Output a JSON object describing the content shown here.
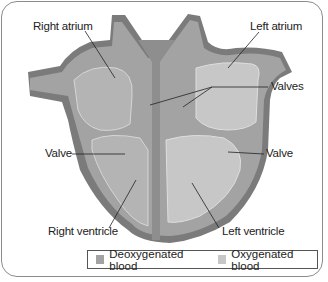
{
  "colors": {
    "deoxygenated": "#a3a3a3",
    "oxygenated": "#c7c7c7",
    "wall": "#7b7b7b",
    "outline": "#8c8c8c"
  },
  "labels": {
    "right_atrium": "Right atrium",
    "left_atrium": "Left atrium",
    "valves": "Valves",
    "valve_left": "Valve",
    "valve_right": "Valve",
    "right_ventricle": "Right ventricle",
    "left_ventricle": "Left ventricle"
  },
  "legend": {
    "items": [
      {
        "label": "Deoxygenated blood",
        "color": "#a3a3a3"
      },
      {
        "label": "Oxygenated blood",
        "color": "#c7c7c7"
      }
    ]
  }
}
